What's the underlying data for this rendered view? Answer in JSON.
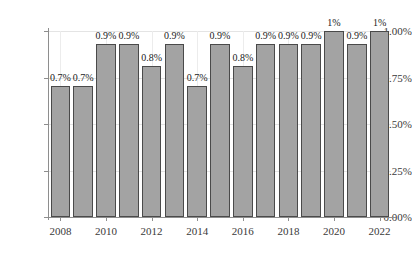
{
  "chart_data": {
    "type": "bar",
    "title": "",
    "subtitle": "",
    "xlabel": "",
    "ylabel": "",
    "categories": [
      "2008",
      "2009",
      "2010",
      "2011",
      "2012",
      "2013",
      "2014",
      "2015",
      "2016",
      "2017",
      "2018",
      "2019",
      "2020",
      "2021",
      "2022"
    ],
    "values": [
      0.705,
      0.705,
      0.93,
      0.93,
      0.81,
      0.93,
      0.705,
      0.93,
      0.81,
      0.93,
      0.93,
      0.93,
      1.0,
      0.93,
      1.0
    ],
    "data_labels": [
      "0.7%",
      "0.7%",
      "0.9%",
      "0.9%",
      "0.8%",
      "0.9%",
      "0.7%",
      "0.9%",
      "0.8%",
      "0.9%",
      "0.9%",
      "0.9%",
      "1%",
      "0.9%",
      "1%"
    ],
    "ylim": [
      0,
      1.0
    ],
    "y_ticks": [
      0,
      0.25,
      0.5,
      0.75,
      1.0
    ],
    "y_tick_labels": [
      "0.00%",
      "0.25%",
      "0.50%",
      "0.75%",
      "1.00%"
    ],
    "x_tick_labels": [
      "2008",
      "2010",
      "2012",
      "2014",
      "2016",
      "2018",
      "2020",
      "2022"
    ],
    "grid": true,
    "legend": false,
    "legend_position": "none",
    "series_color": "#a3a3a3",
    "bar_border_color": "#4a4a4a",
    "grid_color": "#e4e4e4",
    "axis_color": "#8e8e8e",
    "background": "#ffffff"
  }
}
